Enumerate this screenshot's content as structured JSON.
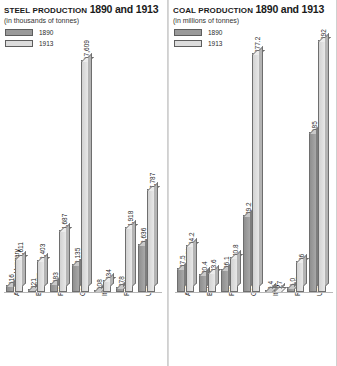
{
  "chart_data": [
    {
      "type": "bar",
      "id": "steel",
      "title": "Steel production 1890 and 1913",
      "title_sc": "Steel production",
      "title_years": "1890 and 1913",
      "subtitle": "(in thousands of tonnes)",
      "xlabel": "",
      "ylabel": "",
      "unit": "thousands of tonnes",
      "grid": false,
      "legend_position": "top-left",
      "categories": [
        "Austria-Hungary",
        "Belgium",
        "France",
        "Germany",
        "Italy",
        "Russia",
        "United Kingdom"
      ],
      "series": [
        {
          "name": "1890",
          "color": "#9a9a9a",
          "values": [
            516,
            221,
            683,
            2135,
            108,
            378,
            3636
          ]
        },
        {
          "name": "1913",
          "color": "#dcdcdc",
          "values": [
            2611,
            2403,
            4687,
            17609,
            934,
            4918,
            7787
          ]
        }
      ],
      "value_labels": {
        "1890": [
          "516",
          "221",
          "683",
          "2,135",
          "108",
          "378",
          "3,636"
        ],
        "1913": [
          "2,611",
          "2,403",
          "4,687",
          "17,609",
          "934",
          "4,918",
          "7,787"
        ]
      },
      "ylim": [
        0,
        17609
      ]
    },
    {
      "type": "bar",
      "id": "coal",
      "title": "Coal production 1890 and 1913",
      "title_sc": "Coal production",
      "title_years": "1890 and 1913",
      "subtitle": "(in millions of tonnes)",
      "xlabel": "",
      "ylabel": "",
      "unit": "millions of tonnes",
      "grid": false,
      "legend_position": "top-left",
      "categories": [
        "Austria-Hungary",
        "Belgium",
        "France",
        "Germany",
        "Italy",
        "Russia",
        "United Kingdom"
      ],
      "series": [
        {
          "name": "1890",
          "color": "#9a9a9a",
          "values": [
            27.5,
            20.4,
            26.1,
            89.2,
            0.4,
            6.0,
            185
          ]
        },
        {
          "name": "1913",
          "color": "#dcdcdc",
          "values": [
            54.2,
            23.6,
            40.8,
            277.2,
            0.7,
            36,
            292
          ]
        }
      ],
      "value_labels": {
        "1890": [
          "27.5",
          "20.4",
          "26.1",
          "89.2",
          "0.4",
          "6.0",
          "185"
        ],
        "1913": [
          "54.2",
          "23.6",
          "40.8",
          "277.2",
          "0.7",
          "36",
          "292"
        ]
      },
      "ylim": [
        0,
        292
      ]
    }
  ],
  "legend": {
    "entries": [
      {
        "label": "1890",
        "color": "#9a9a9a"
      },
      {
        "label": "1913",
        "color": "#dcdcdc"
      }
    ]
  }
}
